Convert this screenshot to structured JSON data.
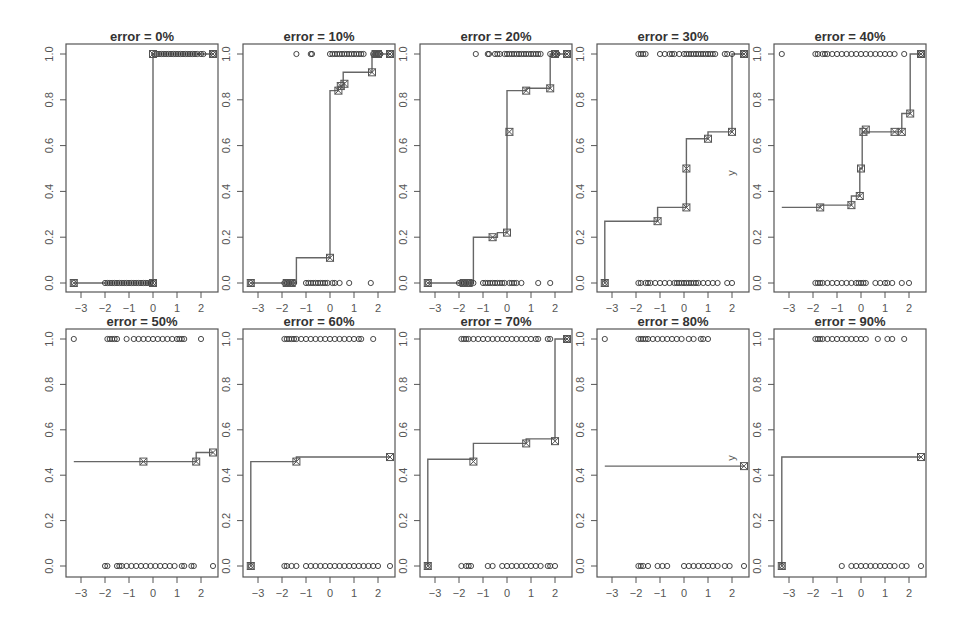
{
  "chart_data": {
    "type": "scatter",
    "layout": {
      "rows": 2,
      "cols": 5
    },
    "xlim": [
      -3.5,
      2.7
    ],
    "ylim": [
      -0.04,
      1.04
    ],
    "xticks": [
      -3,
      -2,
      -1,
      0,
      1,
      2
    ],
    "yticks": [
      0.0,
      0.2,
      0.4,
      0.6,
      0.8,
      1.0
    ],
    "ytick_labels": [
      "0.0",
      "0.2",
      "0.4",
      "0.6",
      "0.8",
      "1.0"
    ],
    "xtick_labels": [
      "-3",
      "-2",
      "-1",
      "0",
      "1",
      "2"
    ],
    "panels": [
      {
        "title": "error = 0%",
        "ylabel": "",
        "points_y1": [
          0.05,
          0.15,
          0.25,
          0.35,
          0.45,
          0.55,
          0.65,
          0.75,
          0.85,
          0.95,
          1.05,
          1.15,
          1.25,
          1.35,
          1.45,
          1.55,
          1.65,
          1.75,
          1.85,
          2.0,
          2.1,
          2.5
        ],
        "points_y0": [
          -3.3,
          -2.0,
          -1.9,
          -1.8,
          -1.7,
          -1.6,
          -1.5,
          -1.4,
          -1.3,
          -1.2,
          -1.1,
          -1.0,
          -0.9,
          -0.8,
          -0.7,
          -0.6,
          -0.5,
          -0.4,
          -0.3,
          -0.2,
          -0.1,
          0.0
        ],
        "step": [
          [
            -3.3,
            0.0
          ],
          [
            0.0,
            0.0
          ],
          [
            0.0,
            1.0
          ],
          [
            2.5,
            1.0
          ]
        ],
        "squares": [
          [
            -3.3,
            0.0
          ],
          [
            0.0,
            0.0
          ],
          [
            0.0,
            1.0
          ],
          [
            2.5,
            1.0
          ]
        ]
      },
      {
        "title": "error = 10%",
        "ylabel": "",
        "points_y1": [
          -1.4,
          -0.8,
          -0.75,
          0.0,
          0.1,
          0.2,
          0.3,
          0.4,
          0.5,
          0.6,
          0.7,
          0.8,
          0.9,
          1.0,
          1.1,
          1.2,
          1.3,
          1.4,
          1.8,
          1.9,
          2.0,
          2.1,
          2.5
        ],
        "points_y0": [
          -3.3,
          -1.9,
          -1.8,
          -1.7,
          -1.6,
          -1.5,
          -1.0,
          -0.9,
          -0.8,
          -0.7,
          -0.6,
          -0.5,
          -0.4,
          -0.3,
          -0.2,
          -0.1,
          0.1,
          0.2,
          0.4,
          0.8,
          1.7
        ],
        "step": [
          [
            -3.3,
            0.0
          ],
          [
            -1.4,
            0.0
          ],
          [
            -1.4,
            0.11
          ],
          [
            0.0,
            0.11
          ],
          [
            0.0,
            0.84
          ],
          [
            0.35,
            0.84
          ],
          [
            0.35,
            0.86
          ],
          [
            0.55,
            0.86
          ],
          [
            0.55,
            0.92
          ],
          [
            1.75,
            0.92
          ],
          [
            1.75,
            1.0
          ],
          [
            2.5,
            1.0
          ]
        ],
        "squares": [
          [
            -3.3,
            0.0
          ],
          [
            -1.8,
            0.0
          ],
          [
            -1.6,
            0.0
          ],
          [
            0.0,
            0.11
          ],
          [
            0.35,
            0.84
          ],
          [
            0.45,
            0.86
          ],
          [
            0.6,
            0.87
          ],
          [
            1.75,
            0.92
          ],
          [
            1.9,
            1.0
          ],
          [
            2.0,
            1.0
          ],
          [
            2.5,
            1.0
          ]
        ]
      },
      {
        "title": "error = 20%",
        "ylabel": "",
        "points_y1": [
          -1.3,
          -0.8,
          -0.75,
          -0.5,
          -0.4,
          -0.3,
          -0.1,
          0.0,
          0.1,
          0.2,
          0.3,
          0.4,
          0.5,
          0.6,
          0.7,
          0.8,
          0.9,
          1.0,
          1.1,
          1.2,
          1.3,
          1.4,
          1.8,
          2.0,
          2.1,
          2.5
        ],
        "points_y0": [
          -3.3,
          -2.0,
          -1.9,
          -1.8,
          -1.7,
          -1.6,
          -1.5,
          -1.4,
          -1.0,
          -0.9,
          -0.8,
          -0.7,
          -0.6,
          -0.5,
          -0.4,
          -0.3,
          -0.2,
          -0.1,
          0.1,
          0.2,
          0.3,
          0.4,
          0.6,
          1.3,
          1.8
        ],
        "step": [
          [
            -3.3,
            0.0
          ],
          [
            -1.4,
            0.0
          ],
          [
            -1.4,
            0.2
          ],
          [
            -0.4,
            0.2
          ],
          [
            -0.4,
            0.22
          ],
          [
            0.0,
            0.22
          ],
          [
            0.0,
            0.84
          ],
          [
            0.8,
            0.84
          ],
          [
            0.8,
            0.85
          ],
          [
            1.8,
            0.85
          ],
          [
            1.8,
            1.0
          ],
          [
            2.5,
            1.0
          ]
        ],
        "squares": [
          [
            -3.3,
            0.0
          ],
          [
            -1.8,
            0.0
          ],
          [
            -1.6,
            0.0
          ],
          [
            -0.6,
            0.2
          ],
          [
            0.0,
            0.22
          ],
          [
            0.1,
            0.66
          ],
          [
            0.8,
            0.84
          ],
          [
            1.8,
            0.85
          ],
          [
            2.0,
            1.0
          ],
          [
            2.5,
            1.0
          ]
        ]
      },
      {
        "title": "error = 30%",
        "ylabel": "y",
        "points_y1": [
          -1.9,
          -1.8,
          -1.7,
          -1.6,
          -1.0,
          -0.8,
          -0.6,
          -0.5,
          -0.4,
          -0.2,
          0.0,
          0.1,
          0.2,
          0.3,
          0.4,
          0.5,
          0.6,
          0.7,
          0.8,
          0.9,
          1.0,
          1.1,
          1.2,
          1.3,
          1.7,
          1.8,
          2.0,
          2.5
        ],
        "points_y0": [
          -3.3,
          -1.9,
          -1.8,
          -1.6,
          -1.5,
          -1.4,
          -1.2,
          -1.0,
          -0.8,
          -0.6,
          -0.4,
          -0.3,
          -0.2,
          -0.1,
          0.0,
          0.1,
          0.2,
          0.3,
          0.4,
          0.5,
          0.6,
          0.8,
          1.0,
          1.2,
          1.4,
          1.8,
          2.0
        ],
        "step": [
          [
            -3.3,
            0.0
          ],
          [
            -3.3,
            0.27
          ],
          [
            -1.1,
            0.27
          ],
          [
            -1.1,
            0.33
          ],
          [
            0.1,
            0.33
          ],
          [
            0.1,
            0.63
          ],
          [
            1.0,
            0.63
          ],
          [
            1.0,
            0.66
          ],
          [
            2.0,
            0.66
          ],
          [
            2.0,
            1.0
          ],
          [
            2.5,
            1.0
          ]
        ],
        "squares": [
          [
            -3.3,
            0.0
          ],
          [
            -1.1,
            0.27
          ],
          [
            0.1,
            0.33
          ],
          [
            0.1,
            0.5
          ],
          [
            1.0,
            0.63
          ],
          [
            2.0,
            0.66
          ],
          [
            2.5,
            1.0
          ]
        ]
      },
      {
        "title": "error = 40%",
        "ylabel": "",
        "points_y1": [
          -3.3,
          -1.9,
          -1.8,
          -1.6,
          -1.5,
          -1.4,
          -1.2,
          -1.0,
          -0.8,
          -0.6,
          -0.4,
          -0.2,
          0.0,
          0.2,
          0.4,
          0.6,
          0.8,
          1.0,
          1.2,
          1.4,
          1.8,
          2.5
        ],
        "points_y0": [
          -1.9,
          -1.8,
          -1.7,
          -1.6,
          -1.4,
          -1.2,
          -1.0,
          -0.8,
          -0.6,
          -0.4,
          -0.2,
          -0.1,
          0.0,
          0.1,
          0.2,
          0.6,
          0.8,
          1.0,
          1.1,
          1.3,
          1.7,
          2.0
        ],
        "step": [
          [
            -3.3,
            0.33
          ],
          [
            -1.7,
            0.33
          ],
          [
            -1.7,
            0.34
          ],
          [
            -0.4,
            0.34
          ],
          [
            -0.4,
            0.38
          ],
          [
            -0.05,
            0.38
          ],
          [
            -0.05,
            0.5
          ],
          [
            0.05,
            0.5
          ],
          [
            0.05,
            0.66
          ],
          [
            1.7,
            0.66
          ],
          [
            1.7,
            0.74
          ],
          [
            2.05,
            0.74
          ],
          [
            2.05,
            1.0
          ],
          [
            2.5,
            1.0
          ]
        ],
        "squares": [
          [
            -1.7,
            0.33
          ],
          [
            -0.4,
            0.34
          ],
          [
            -0.05,
            0.38
          ],
          [
            0.0,
            0.5
          ],
          [
            0.1,
            0.66
          ],
          [
            0.2,
            0.67
          ],
          [
            1.4,
            0.66
          ],
          [
            1.7,
            0.66
          ],
          [
            2.05,
            0.74
          ],
          [
            2.5,
            1.0
          ]
        ]
      },
      {
        "title": "error = 50%",
        "ylabel": "",
        "points_y1": [
          -3.3,
          -1.9,
          -1.8,
          -1.7,
          -1.6,
          -1.5,
          -1.1,
          -0.8,
          -0.6,
          -0.4,
          -0.2,
          0.0,
          0.2,
          0.4,
          0.6,
          0.8,
          1.0,
          1.1,
          1.2,
          1.3,
          2.0
        ],
        "points_y0": [
          -2.0,
          -1.9,
          -1.5,
          -1.4,
          -1.3,
          -1.1,
          -0.9,
          -0.7,
          -0.5,
          -0.3,
          -0.1,
          0.1,
          0.3,
          0.5,
          0.7,
          0.9,
          1.2,
          1.3,
          1.6,
          1.7,
          2.5
        ],
        "step": [
          [
            -3.3,
            0.46
          ],
          [
            1.8,
            0.46
          ],
          [
            1.8,
            0.5
          ],
          [
            2.5,
            0.5
          ]
        ],
        "squares": [
          [
            -0.4,
            0.46
          ],
          [
            1.8,
            0.46
          ],
          [
            2.5,
            0.5
          ]
        ]
      },
      {
        "title": "error = 60%",
        "ylabel": "",
        "points_y1": [
          -1.9,
          -1.8,
          -1.7,
          -1.6,
          -1.5,
          -1.4,
          -1.2,
          -1.0,
          -0.8,
          -0.6,
          -0.4,
          -0.2,
          0.0,
          0.2,
          0.4,
          0.6,
          0.8,
          1.0,
          1.2,
          1.3,
          1.8
        ],
        "points_y0": [
          -3.3,
          -1.9,
          -1.8,
          -1.6,
          -1.4,
          -1.0,
          -0.8,
          -0.6,
          -0.4,
          -0.2,
          0.0,
          0.2,
          0.4,
          0.6,
          0.8,
          1.0,
          1.2,
          1.4,
          1.6,
          1.8,
          2.0,
          2.5
        ],
        "step": [
          [
            -3.3,
            0.0
          ],
          [
            -3.3,
            0.46
          ],
          [
            -1.4,
            0.46
          ],
          [
            -1.4,
            0.48
          ],
          [
            2.5,
            0.48
          ]
        ],
        "squares": [
          [
            -3.3,
            0.0
          ],
          [
            -1.4,
            0.46
          ],
          [
            2.5,
            0.48
          ]
        ]
      },
      {
        "title": "error = 70%",
        "ylabel": "",
        "points_y1": [
          -1.9,
          -1.8,
          -1.7,
          -1.6,
          -1.4,
          -1.2,
          -1.0,
          -0.8,
          -0.6,
          -0.4,
          -0.2,
          0.0,
          0.2,
          0.4,
          0.6,
          0.8,
          1.0,
          1.2,
          1.3,
          1.7,
          1.8,
          2.5
        ],
        "points_y0": [
          -3.3,
          -1.9,
          -1.7,
          -1.6,
          -1.5,
          -0.8,
          -0.6,
          -0.2,
          0.0,
          0.2,
          0.4,
          0.6,
          0.8,
          1.0,
          1.2,
          1.4,
          1.7,
          1.8,
          2.0
        ],
        "step": [
          [
            -3.3,
            0.0
          ],
          [
            -3.3,
            0.47
          ],
          [
            -1.4,
            0.47
          ],
          [
            -1.4,
            0.54
          ],
          [
            0.8,
            0.54
          ],
          [
            0.8,
            0.56
          ],
          [
            2.0,
            0.56
          ],
          [
            2.0,
            1.0
          ],
          [
            2.5,
            1.0
          ]
        ],
        "squares": [
          [
            -3.3,
            0.0
          ],
          [
            -1.4,
            0.46
          ],
          [
            0.8,
            0.54
          ],
          [
            2.0,
            0.55
          ],
          [
            2.5,
            1.0
          ]
        ]
      },
      {
        "title": "error = 80%",
        "ylabel": "y",
        "points_y1": [
          -3.3,
          -1.9,
          -1.8,
          -1.7,
          -1.6,
          -1.5,
          -1.3,
          -1.1,
          -0.9,
          -0.7,
          -0.5,
          -0.3,
          -0.1,
          0.2,
          0.4,
          0.7,
          0.8,
          1.0
        ],
        "points_y0": [
          -1.9,
          -1.8,
          -1.7,
          -1.5,
          -1.1,
          -0.9,
          -0.7,
          0.0,
          0.2,
          0.4,
          0.6,
          0.8,
          1.0,
          1.2,
          1.4,
          1.7,
          1.9,
          2.5
        ],
        "step": [
          [
            -3.3,
            0.44
          ],
          [
            2.5,
            0.44
          ]
        ],
        "squares": [
          [
            2.5,
            0.44
          ]
        ]
      },
      {
        "title": "error = 90%",
        "ylabel": "",
        "points_y1": [
          -1.9,
          -1.8,
          -1.7,
          -1.6,
          -1.4,
          -1.2,
          -1.0,
          -0.8,
          -0.6,
          -0.4,
          -0.2,
          0.0,
          0.2,
          0.7,
          1.1,
          1.3,
          1.8
        ],
        "points_y0": [
          -3.3,
          -0.8,
          -0.4,
          -0.2,
          0.0,
          0.2,
          0.4,
          0.6,
          0.8,
          1.0,
          1.2,
          1.4,
          1.7,
          1.9,
          2.5
        ],
        "step": [
          [
            -3.3,
            0.0
          ],
          [
            -3.3,
            0.48
          ],
          [
            2.5,
            0.48
          ]
        ],
        "squares": [
          [
            -3.3,
            0.0
          ],
          [
            2.5,
            0.48
          ]
        ]
      }
    ]
  }
}
